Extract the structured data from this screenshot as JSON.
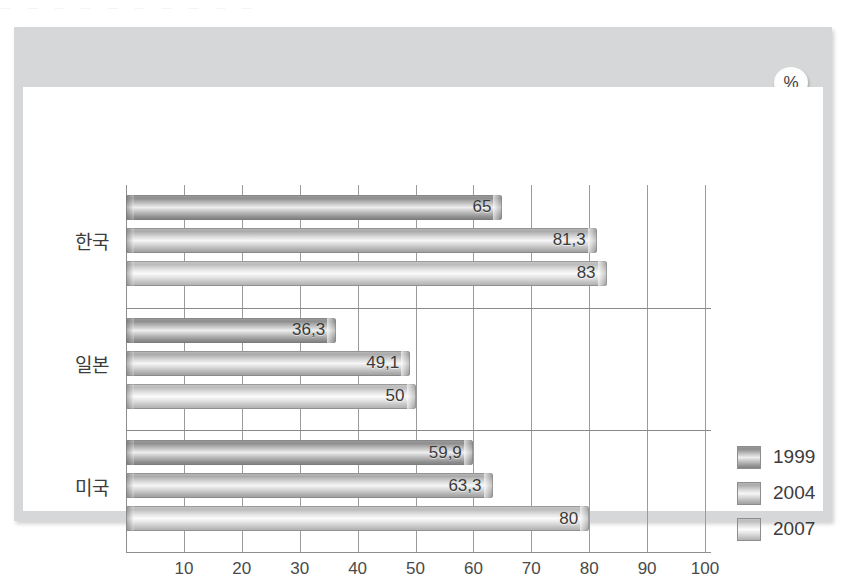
{
  "badge": {
    "label": "%"
  },
  "top_artifact": {
    "text": "ㅡ ㅡ  ㅡ  ㅡ  ㅡ  ㅡ  ㅡ  ㅡ  ㅡ  ㅡ"
  },
  "legend": {
    "position": "right",
    "items": [
      {
        "label": "1999",
        "color": "#9d9d9d"
      },
      {
        "label": "2004",
        "color": "#b8b8b8"
      },
      {
        "label": "2007",
        "color": "#c7c7c7"
      }
    ]
  },
  "axis": {
    "ticks": [
      "10",
      "20",
      "30",
      "40",
      "50",
      "60",
      "70",
      "80",
      "90",
      "100"
    ]
  },
  "chart_data": {
    "type": "bar",
    "orientation": "horizontal",
    "title": "",
    "subtitle": "",
    "xlabel": "",
    "ylabel": "",
    "unit": "%",
    "xlim": [
      0,
      100
    ],
    "xticks": [
      0,
      10,
      20,
      30,
      40,
      50,
      60,
      70,
      80,
      90,
      100
    ],
    "grid": true,
    "legend_position": "right",
    "categories": [
      "한국",
      "일본",
      "미국"
    ],
    "series": [
      {
        "name": "1999",
        "values": [
          65,
          36.3,
          59.9
        ],
        "labels": [
          "65",
          "36,3",
          "59,9"
        ]
      },
      {
        "name": "2004",
        "values": [
          81.3,
          49.1,
          63.3
        ],
        "labels": [
          "81,3",
          "49,1",
          "63,3"
        ]
      },
      {
        "name": "2007",
        "values": [
          83,
          50,
          80
        ],
        "labels": [
          "83",
          "50",
          "80"
        ]
      }
    ]
  }
}
